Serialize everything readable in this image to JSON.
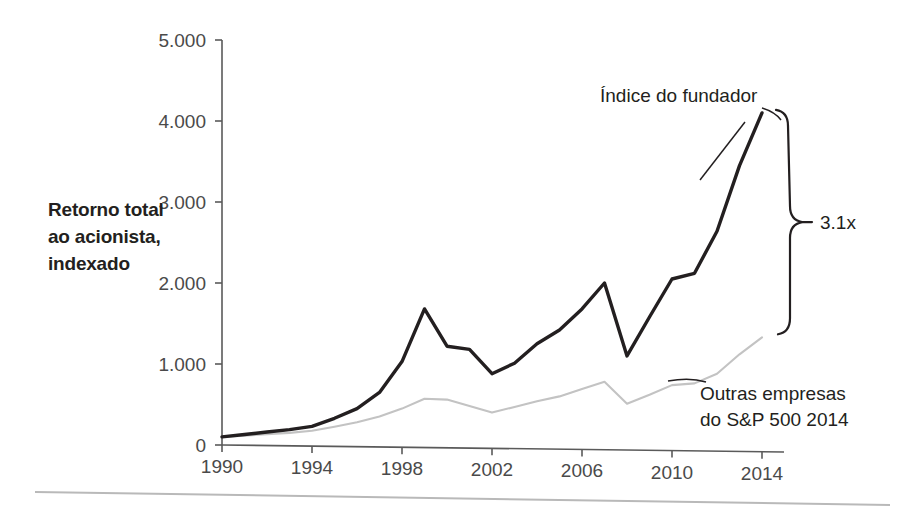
{
  "chart_data": {
    "type": "line",
    "title": "",
    "xlabel": "",
    "ylabel": "Retorno total ao acionista, indexado",
    "ylabel_lines": [
      "Retorno total",
      "ao acionista,",
      "indexado"
    ],
    "x": [
      1990,
      1991,
      1992,
      1993,
      1994,
      1995,
      1996,
      1997,
      1998,
      1999,
      2000,
      2001,
      2002,
      2003,
      2004,
      2005,
      2006,
      2007,
      2008,
      2009,
      2010,
      2011,
      2012,
      2013,
      2014
    ],
    "xlim": [
      1990,
      2014
    ],
    "ylim": [
      0,
      5000
    ],
    "xticks": [
      "1990",
      "1994",
      "1998",
      "2002",
      "2006",
      "2010",
      "2014"
    ],
    "xtick_values": [
      1990,
      1994,
      1998,
      2002,
      2006,
      2010,
      2014
    ],
    "yticks": [
      "0",
      "1.000",
      "2.000",
      "3.000",
      "4.000",
      "5.000"
    ],
    "ytick_values": [
      0,
      1000,
      2000,
      3000,
      4000,
      5000
    ],
    "grid": false,
    "legend_position": "inline-annotations",
    "series": [
      {
        "name": "Índice do fundador",
        "color": "#231f20",
        "values": [
          100,
          130,
          160,
          190,
          230,
          330,
          450,
          650,
          1030,
          1680,
          1220,
          1180,
          880,
          1010,
          1250,
          1420,
          1680,
          2000,
          1100,
          1580,
          2050,
          2120,
          2640,
          3450,
          4100
        ]
      },
      {
        "name": "Outras empresas do S&P 500 2014",
        "color": "#c3c3c3",
        "values": [
          100,
          115,
          135,
          150,
          175,
          225,
          280,
          350,
          450,
          570,
          560,
          480,
          400,
          470,
          540,
          600,
          690,
          780,
          510,
          620,
          740,
          760,
          880,
          1120,
          1330
        ]
      }
    ],
    "annotations": [
      {
        "name": "founder-index-label",
        "text": "Índice do fundador",
        "x": 600,
        "y": 102
      },
      {
        "name": "sp500-label-line1",
        "text": "Outras empresas",
        "x": 700,
        "y": 400
      },
      {
        "name": "sp500-label-line2",
        "text": "do S&P 500 2014",
        "x": 700,
        "y": 426
      },
      {
        "name": "multiplier-label",
        "text": "3.1x",
        "x": 820,
        "y": 232
      }
    ],
    "multiplier": "3.1x",
    "colors": {
      "founder_line": "#231f20",
      "sp500_line": "#c3c3c3",
      "axis": "#5a5a5a",
      "text": "#231f20",
      "footer_rule": "#b9b9b9"
    }
  }
}
